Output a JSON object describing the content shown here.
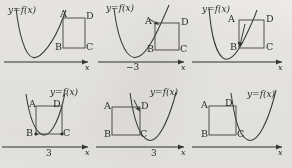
{
  "figure": {
    "function_label": "y=f(x)",
    "axis_label": "x",
    "square_corners": {
      "top_left": "A",
      "top_right": "D",
      "bottom_left": "B",
      "bottom_right": "C"
    },
    "panels": [
      {
        "id": "panel-1",
        "function_label": "y=f(x)",
        "axis_label": "x",
        "axis_tick_label": "",
        "corner_a": "A",
        "corner_b": "B",
        "corner_c": "C",
        "corner_d": "D",
        "description": "parabola with right branch rising through corner A of the square"
      },
      {
        "id": "panel-2",
        "function_label": "y=f(x)",
        "axis_label": "x",
        "axis_tick_label": "−3",
        "corner_a": "A",
        "corner_b": "B",
        "corner_c": "C",
        "corner_d": "D",
        "description": "parabola vertex at −3, arrow pointing to corner A"
      },
      {
        "id": "panel-3",
        "function_label": "y=f(x)",
        "axis_label": "x",
        "axis_tick_label": "",
        "corner_a": "A",
        "corner_b": "B",
        "corner_c": "C",
        "corner_d": "D",
        "description": "parabola rising diagonally through corners B and D, arrow pointing to B"
      },
      {
        "id": "panel-4",
        "function_label": "y=f(x)",
        "axis_label": "x",
        "axis_tick_label": "3",
        "corner_a": "A",
        "corner_b": "B",
        "corner_c": "C",
        "corner_d": "D",
        "description": "parabola passing through bottom corners B and C, vertex at 3"
      },
      {
        "id": "panel-5",
        "function_label": "y=f(x)",
        "axis_label": "x",
        "axis_tick_label": "3",
        "corner_a": "A",
        "corner_b": "B",
        "corner_c": "C",
        "corner_d": "D",
        "description": "square at left, parabola vertex at 3, arrow pointing to corner D"
      },
      {
        "id": "panel-6",
        "function_label": "y=f(x)",
        "axis_label": "x",
        "axis_tick_label": "",
        "corner_a": "A",
        "corner_b": "B",
        "corner_c": "C",
        "corner_d": "D",
        "description": "square at left with parabola left branch descending past corners D and C"
      }
    ],
    "colors": {
      "background": "#efeeea",
      "curve": "#3a3a3a",
      "axis": "#6f6f6f",
      "square": "#4a4a4a",
      "text": "#2c2c2c"
    }
  }
}
